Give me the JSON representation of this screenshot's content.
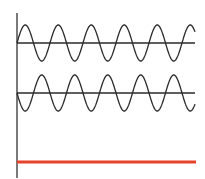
{
  "diagram": {
    "type": "wave-interference",
    "colors": {
      "axis": "#333333",
      "wave": "#2a2a2a",
      "baseline": "#2a2a2a",
      "result": "#e8432a",
      "background": "#ffffff"
    },
    "axis": {
      "x": 17,
      "y_top": 13,
      "y_bottom": 178
    },
    "waves": [
      {
        "name": "wave-1",
        "center_y": 43,
        "amplitude": 18,
        "x_start": 17,
        "x_end": 195,
        "period": 33,
        "phase": 0
      },
      {
        "name": "wave-2",
        "center_y": 93,
        "amplitude": 18,
        "x_start": 17,
        "x_end": 195,
        "period": 33,
        "phase": 180
      }
    ],
    "result_line": {
      "name": "resultant-flat-line",
      "y": 162,
      "x_start": 17,
      "x_end": 196,
      "thickness": 3
    }
  }
}
